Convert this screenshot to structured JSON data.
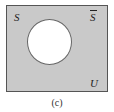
{
  "diagram": {
    "type": "venn",
    "universe_label": "U",
    "set_label": "S",
    "complement_label": "S",
    "complement_has_overbar": true,
    "shaded_region": "complement of S",
    "caption": "(c)",
    "colors": {
      "shaded": "#c9c9c9",
      "unshaded": "#ffffff",
      "border": "#555555"
    }
  }
}
